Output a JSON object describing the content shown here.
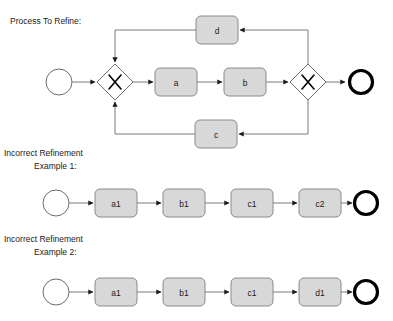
{
  "diagram": {
    "type": "bpmn-process-refinement",
    "background": "#ffffff",
    "colors": {
      "task_fill": "#d8d8d8",
      "task_stroke": "#8a8a8a",
      "flow_stroke": "#7a7a7a",
      "start_event_stroke": "#6d6d6d",
      "end_event_stroke": "#000000",
      "text": "#1a1a1a"
    },
    "sections": [
      {
        "id": "process-to-refine",
        "caption_lines": [
          "Process To Refine:"
        ],
        "start_event": {
          "name": "start-event",
          "label": ""
        },
        "end_event": {
          "name": "end-event",
          "label": ""
        },
        "gateways": [
          {
            "name": "split-gateway",
            "kind": "exclusive",
            "glyph": "X"
          },
          {
            "name": "join-gateway",
            "kind": "exclusive",
            "glyph": "X"
          }
        ],
        "tasks": [
          {
            "name": "task-d",
            "label": "d"
          },
          {
            "name": "task-a",
            "label": "a"
          },
          {
            "name": "task-b",
            "label": "b"
          },
          {
            "name": "task-c",
            "label": "c"
          }
        ]
      },
      {
        "id": "incorrect-refinement-example-1",
        "caption_lines": [
          "Incorrect Refinement",
          "Example 1:"
        ],
        "start_event": {
          "name": "start-event",
          "label": ""
        },
        "end_event": {
          "name": "end-event",
          "label": ""
        },
        "tasks": [
          {
            "name": "task-a1",
            "label": "a1"
          },
          {
            "name": "task-b1",
            "label": "b1"
          },
          {
            "name": "task-c1",
            "label": "c1"
          },
          {
            "name": "task-c2",
            "label": "c2"
          }
        ]
      },
      {
        "id": "incorrect-refinement-example-2",
        "caption_lines": [
          "Incorrect Refinement",
          "Example 2:"
        ],
        "start_event": {
          "name": "start-event",
          "label": ""
        },
        "end_event": {
          "name": "end-event",
          "label": ""
        },
        "tasks": [
          {
            "name": "task-a1",
            "label": "a1"
          },
          {
            "name": "task-b1",
            "label": "b1"
          },
          {
            "name": "task-c1",
            "label": "c1"
          },
          {
            "name": "task-d1",
            "label": "d1"
          }
        ]
      }
    ]
  }
}
